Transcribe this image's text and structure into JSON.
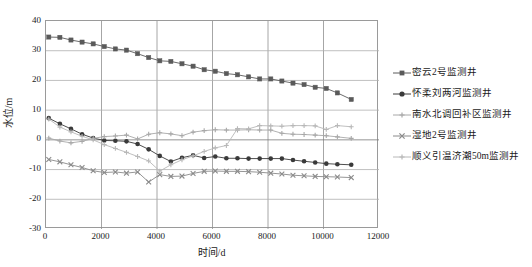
{
  "chart_data": {
    "type": "line",
    "title": "",
    "xlabel": "时间/d",
    "ylabel": "水位/m",
    "xlim": [
      0,
      12000
    ],
    "ylim": [
      -30,
      40
    ],
    "xticks": [
      0,
      2000,
      4000,
      6000,
      8000,
      10000,
      12000
    ],
    "yticks": [
      40,
      30,
      20,
      10,
      0,
      -10,
      -20,
      -30
    ],
    "grid": true,
    "legend_position": "right",
    "x": [
      100,
      500,
      900,
      1300,
      1700,
      2100,
      2500,
      2900,
      3300,
      3700,
      4100,
      4500,
      4900,
      5300,
      5700,
      6100,
      6500,
      6900,
      7300,
      7700,
      8100,
      8500,
      8900,
      9300,
      9700,
      10100,
      10500,
      11000
    ],
    "series": [
      {
        "name": "密云2号监测井",
        "marker": "square",
        "color": "#5a5a5a",
        "values": [
          34.6,
          34.5,
          33.6,
          32.9,
          32.3,
          31.4,
          30.6,
          30.2,
          29.0,
          27.7,
          26.6,
          26.4,
          25.6,
          24.8,
          23.6,
          23.1,
          22.3,
          21.9,
          21.2,
          20.5,
          20.5,
          19.8,
          19.1,
          18.6,
          17.7,
          17.3,
          15.8,
          13.6
        ]
      },
      {
        "name": "怀柔刘两河监测井",
        "marker": "circle",
        "color": "#3a3a3a",
        "values": [
          7.3,
          5.4,
          3.7,
          1.9,
          0.6,
          -0.2,
          -0.3,
          -0.5,
          -1.4,
          -3.2,
          -5.4,
          -7.3,
          -6.0,
          -5.2,
          -6.1,
          -5.6,
          -6.2,
          -6.2,
          -6.3,
          -6.3,
          -6.3,
          -6.3,
          -6.8,
          -7.2,
          -7.6,
          -8.0,
          -8.2,
          -8.4
        ]
      },
      {
        "name": "南水北调回补区监测井",
        "marker": "plus",
        "color": "#a8a8a8",
        "values": [
          0.6,
          -0.4,
          -1.0,
          -0.5,
          0.5,
          1.1,
          1.3,
          1.6,
          0.3,
          1.9,
          2.4,
          2.0,
          1.4,
          2.6,
          3.1,
          3.4,
          3.3,
          3.3,
          3.4,
          3.3,
          3.3,
          2.2,
          1.9,
          1.8,
          1.6,
          1.4,
          1.0,
          0.5
        ]
      },
      {
        "name": "湿地2号监测井",
        "marker": "cross",
        "color": "#8a8a8a",
        "values": [
          -6.6,
          -7.4,
          -8.4,
          -9.3,
          -10.4,
          -11.0,
          -10.8,
          -11.2,
          -10.8,
          -14.2,
          -11.7,
          -12.3,
          -12.2,
          -11.3,
          -10.6,
          -10.5,
          -10.6,
          -10.6,
          -10.7,
          -10.9,
          -11.2,
          -11.5,
          -11.9,
          -12.1,
          -12.3,
          -12.4,
          -12.5,
          -12.7
        ]
      },
      {
        "name": "顺义引温济潮50m监测井",
        "marker": "plus",
        "color": "#b8b8b8",
        "values": [
          7.0,
          4.3,
          2.7,
          1.2,
          0.0,
          -1.6,
          -2.9,
          -4.2,
          -5.6,
          -7.1,
          -10.5,
          -8.4,
          -6.7,
          -5.4,
          -3.9,
          -2.7,
          -1.9,
          3.8,
          3.7,
          4.8,
          4.7,
          4.6,
          4.8,
          4.8,
          4.7,
          3.5,
          4.8,
          4.4
        ]
      }
    ]
  }
}
